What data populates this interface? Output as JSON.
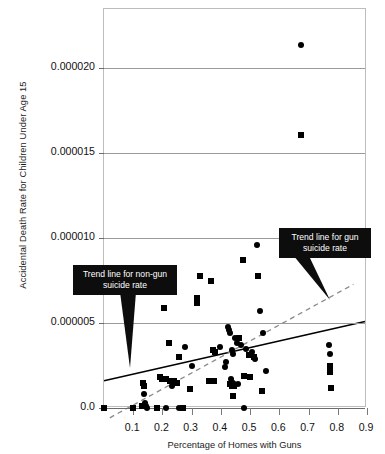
{
  "chart_data": {
    "type": "scatter",
    "title": "",
    "xlabel": "Percentage of Homes with Guns",
    "ylabel": "Accidental Death Rate for Children Under Age 15",
    "xlim": [
      0.0,
      0.9
    ],
    "ylim": [
      0.0,
      2.35e-05
    ],
    "grid": true,
    "legend_position": "none",
    "xticks": [
      0.1,
      0.2,
      0.3,
      0.4,
      0.5,
      0.6,
      0.7,
      0.8,
      0.9
    ],
    "xtick_labels": [
      "0.1",
      "0.2",
      "0.3",
      "0.4",
      "0.5",
      "0.6",
      "0.7",
      "0.8",
      "0.9"
    ],
    "yticks": [
      0.0,
      5e-06,
      1e-05,
      1.5e-05,
      2e-05
    ],
    "ytick_labels": [
      "0.0",
      "0.000005",
      "0.000010",
      "0.000015",
      "0.000020"
    ],
    "series": [
      {
        "name": "gun suicide rate",
        "marker": "circle",
        "color": "#000000",
        "points": [
          [
            0.673,
            2.14e-05
          ],
          [
            0.525,
            9.6e-06
          ],
          [
            0.533,
            5.7e-06
          ],
          [
            0.543,
            4.4e-06
          ],
          [
            0.423,
            4.8e-06
          ],
          [
            0.428,
            4.6e-06
          ],
          [
            0.432,
            4.4e-06
          ],
          [
            0.447,
            4.1e-06
          ],
          [
            0.455,
            3.8e-06
          ],
          [
            0.47,
            3.7e-06
          ],
          [
            0.487,
            3.5e-06
          ],
          [
            0.505,
            3.3e-06
          ],
          [
            0.512,
            3e-06
          ],
          [
            0.518,
            2.9e-06
          ],
          [
            0.397,
            3.6e-06
          ],
          [
            0.277,
            3.6e-06
          ],
          [
            0.437,
            3.4e-06
          ],
          [
            0.442,
            3.2e-06
          ],
          [
            0.419,
            2.7e-06
          ],
          [
            0.414,
            2.4e-06
          ],
          [
            0.3,
            2.5e-06
          ],
          [
            0.553,
            2.2e-06
          ],
          [
            0.434,
            1.7e-06
          ],
          [
            0.44,
            1.5e-06
          ],
          [
            0.458,
            1.4e-06
          ],
          [
            0.232,
            1.3e-06
          ],
          [
            0.77,
            3.7e-06
          ],
          [
            0.772,
            3.2e-06
          ],
          [
            0.137,
            8e-07
          ],
          [
            0.14,
            3e-07
          ],
          [
            0.143,
            1e-07
          ],
          [
            0.146,
            0.0
          ],
          [
            0.213,
            0.0
          ],
          [
            0.258,
            0.0
          ],
          [
            0.48,
            0.0
          ]
        ]
      },
      {
        "name": "non-gun suicide rate",
        "marker": "square",
        "color": "#000000",
        "points": [
          [
            0.673,
            1.61e-05
          ],
          [
            0.475,
            8.7e-06
          ],
          [
            0.33,
            7.8e-06
          ],
          [
            0.527,
            7.8e-06
          ],
          [
            0.367,
            7.5e-06
          ],
          [
            0.318,
            6.5e-06
          ],
          [
            0.319,
            6.2e-06
          ],
          [
            0.205,
            5.9e-06
          ],
          [
            0.462,
            4.1e-06
          ],
          [
            0.223,
            3.8e-06
          ],
          [
            0.372,
            3.4e-06
          ],
          [
            0.38,
            3.3e-06
          ],
          [
            0.258,
            3e-06
          ],
          [
            0.497,
            3.1e-06
          ],
          [
            0.512,
            3e-06
          ],
          [
            0.772,
            2.5e-06
          ],
          [
            0.774,
            2.1e-06
          ],
          [
            0.192,
            1.8e-06
          ],
          [
            0.2,
            1.7e-06
          ],
          [
            0.213,
            1.7e-06
          ],
          [
            0.226,
            1.6e-06
          ],
          [
            0.238,
            1.6e-06
          ],
          [
            0.249,
            1.5e-06
          ],
          [
            0.361,
            1.6e-06
          ],
          [
            0.368,
            1.6e-06
          ],
          [
            0.375,
            1.6e-06
          ],
          [
            0.133,
            1.5e-06
          ],
          [
            0.136,
            1.3e-06
          ],
          [
            0.478,
            1.9e-06
          ],
          [
            0.5,
            1.8e-06
          ],
          [
            0.43,
            1.4e-06
          ],
          [
            0.437,
            1.3e-06
          ],
          [
            0.444,
            1.3e-06
          ],
          [
            0.293,
            1.1e-06
          ],
          [
            0.441,
            7e-07
          ],
          [
            0.54,
            1e-06
          ],
          [
            0.776,
            1.2e-06
          ],
          [
            0.0,
            0.0
          ],
          [
            0.1,
            0.0
          ],
          [
            0.131,
            1e-07
          ],
          [
            0.181,
            0.0
          ],
          [
            0.271,
            0.0
          ]
        ]
      }
    ],
    "trend_lines": [
      {
        "name": "non-gun suicide rate",
        "style": "solid",
        "color": "#000000",
        "x0": 0.0,
        "y0": 1.5e-06,
        "x1": 0.9,
        "y1": 5e-06
      },
      {
        "name": "gun suicide rate",
        "style": "dashed",
        "color": "#8a8a8a",
        "x0": 0.02,
        "y0": -7e-07,
        "x1": 0.86,
        "y1": 7.2e-06
      }
    ],
    "annotations": [
      {
        "id": "nongun",
        "text": "Trend line for non-gun suicide rate"
      },
      {
        "id": "gun",
        "text": "Trend line for gun suicide rate"
      }
    ]
  }
}
